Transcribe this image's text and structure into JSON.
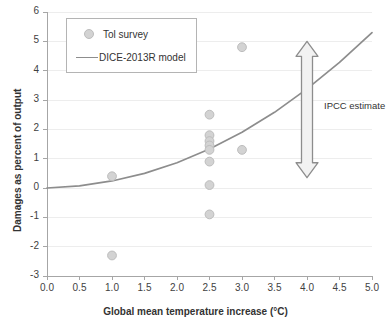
{
  "chart_data": {
    "type": "scatter",
    "title": "",
    "xlabel": "Global mean temperature increase (°C)",
    "ylabel": "Damages as percent of output",
    "xlim": [
      0.0,
      5.0
    ],
    "ylim": [
      -3,
      6
    ],
    "xticks": [
      "0.0",
      "0.5",
      "1.0",
      "1.5",
      "2.0",
      "2.5",
      "3.0",
      "3.5",
      "4.0",
      "4.5",
      "5.0"
    ],
    "xtick_values": [
      0.0,
      0.5,
      1.0,
      1.5,
      2.0,
      2.5,
      3.0,
      3.5,
      4.0,
      4.5,
      5.0
    ],
    "yticks": [
      "6",
      "5",
      "4",
      "3",
      "2",
      "1",
      "0",
      "-1",
      "-2",
      "-3"
    ],
    "ytick_values": [
      6,
      5,
      4,
      3,
      2,
      1,
      0,
      -1,
      -2,
      -3
    ],
    "grid": true,
    "grid_axis": "y",
    "legend_position": "top-left",
    "series": [
      {
        "name": "Tol survey",
        "type": "scatter",
        "marker": "circle",
        "color": "#d3d3d3",
        "edge_color": "#bdbdbd",
        "points": [
          {
            "x": 1.0,
            "y": 0.4
          },
          {
            "x": 1.0,
            "y": -2.3
          },
          {
            "x": 2.5,
            "y": 2.5
          },
          {
            "x": 2.5,
            "y": 1.8
          },
          {
            "x": 2.5,
            "y": 1.6
          },
          {
            "x": 2.5,
            "y": 1.45
          },
          {
            "x": 2.5,
            "y": 1.3
          },
          {
            "x": 2.5,
            "y": 0.9
          },
          {
            "x": 2.5,
            "y": 0.1
          },
          {
            "x": 2.5,
            "y": -0.9
          },
          {
            "x": 3.0,
            "y": 4.8
          },
          {
            "x": 3.0,
            "y": 1.3
          }
        ]
      },
      {
        "name": "DICE-2013R model",
        "type": "line",
        "color": "#8d8d8d",
        "points": [
          {
            "x": 0.0,
            "y": 0.0
          },
          {
            "x": 0.5,
            "y": 0.07
          },
          {
            "x": 1.0,
            "y": 0.24
          },
          {
            "x": 1.5,
            "y": 0.5
          },
          {
            "x": 2.0,
            "y": 0.86
          },
          {
            "x": 2.5,
            "y": 1.33
          },
          {
            "x": 3.0,
            "y": 1.9
          },
          {
            "x": 3.5,
            "y": 2.58
          },
          {
            "x": 4.0,
            "y": 3.38
          },
          {
            "x": 4.5,
            "y": 4.28
          },
          {
            "x": 5.0,
            "y": 5.3
          }
        ]
      }
    ],
    "annotations": [
      {
        "name": "ipcc-estimate",
        "label": "IPCC estimate",
        "type": "double-arrow",
        "x": 4.0,
        "y_top": 5.0,
        "y_bottom": 0.35,
        "color": "#8d8d8d"
      }
    ]
  },
  "legend": {
    "items": [
      {
        "label": "Tol survey",
        "glyph": "circle-marker"
      },
      {
        "label": "DICE-2013R model",
        "glyph": "line-swatch"
      }
    ]
  },
  "axes": {
    "x_title": "Global mean temperature increase (°C)",
    "y_title": "Damages as percent of output",
    "x_labels": [
      "0.0",
      "0.5",
      "1.0",
      "1.5",
      "2.0",
      "2.5",
      "3.0",
      "3.5",
      "4.0",
      "4.5",
      "5.0"
    ],
    "y_labels": [
      "6",
      "5",
      "4",
      "3",
      "2",
      "1",
      "0",
      "-1",
      "-2",
      "-3"
    ]
  },
  "annotation": {
    "ipcc_label": "IPCC estimate"
  },
  "colors": {
    "marker_fill": "#d3d3d3",
    "marker_edge": "#bdbdbd",
    "line": "#8d8d8d",
    "grid": "#ededed",
    "axis": "#a6a6a6",
    "text": "#3f3f3f",
    "background": "#ffffff"
  }
}
